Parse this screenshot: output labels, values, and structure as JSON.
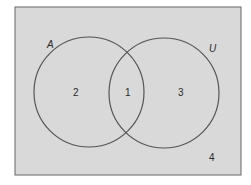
{
  "diagram": {
    "type": "venn",
    "background_color": "#d9d9d9",
    "stroke_color": "#555555",
    "sets": [
      {
        "label": "A"
      },
      {
        "label": "U"
      }
    ],
    "regions": [
      {
        "label": "2",
        "description": "A only"
      },
      {
        "label": "1",
        "description": "intersection"
      },
      {
        "label": "3",
        "description": "U circle only"
      },
      {
        "label": "4",
        "description": "outside both"
      }
    ]
  }
}
